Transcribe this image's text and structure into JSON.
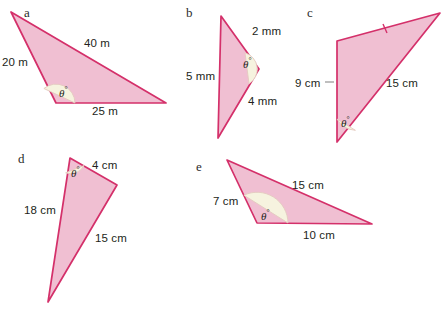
{
  "page": {
    "background_color": "#ffffff",
    "shape_fill": "#f0bfd2",
    "shape_stroke": "#d4306a",
    "arc_fill": "#f6f3df",
    "text_color": "#231f20",
    "width": 443,
    "height": 311
  },
  "figures": [
    {
      "key": "a",
      "letter": "a",
      "letter_pos": {
        "x": 24,
        "y": 6
      },
      "points": "11,12 56,103 166,103",
      "angle": {
        "label": "θ",
        "degree_symbol": "°",
        "pos": {
          "x": 59,
          "y": 86
        },
        "arc_path": "M 75,103 A 19,19 0 0 0 43.9,88.5 Z"
      },
      "side_labels": [
        {
          "name": "side-20m",
          "text": "20 m",
          "x": 2,
          "y": 57
        },
        {
          "name": "side-40m",
          "text": "40 m",
          "x": 84,
          "y": 38
        },
        {
          "name": "side-25m",
          "text": "25 m",
          "x": 92,
          "y": 106
        }
      ],
      "ticks": [],
      "leaders": []
    },
    {
      "key": "b",
      "letter": "b",
      "letter_pos": {
        "x": 186,
        "y": 6
      },
      "points": "221,16 259,69 218,138",
      "angle": {
        "label": "θ",
        "degree_symbol": "°",
        "pos": {
          "x": 243,
          "y": 57
        },
        "arc_path": "M 245,52.8 A 17,17 0 0 1 249,83.7 Z"
      },
      "side_labels": [
        {
          "name": "side-2mm",
          "text": "2 mm",
          "x": 252,
          "y": 26
        },
        {
          "name": "side-5mm",
          "text": "5 mm",
          "x": 186,
          "y": 71
        },
        {
          "name": "side-4mm",
          "text": "4 mm",
          "x": 248,
          "y": 96
        }
      ],
      "ticks": [],
      "leaders": []
    },
    {
      "key": "c",
      "letter": "c",
      "letter_pos": {
        "x": 307,
        "y": 6
      },
      "points": "337,41 440,13 337,142",
      "angle": {
        "label": "θ",
        "degree_symbol": "°",
        "pos": {
          "x": 341,
          "y": 116
        },
        "arc_path": "M 337,119 A 23,23 0 0 0 355.4,130.3 Z"
      },
      "side_labels": [
        {
          "name": "side-9cm",
          "text": "9 cm",
          "x": 295,
          "y": 78
        },
        {
          "name": "side-15cm",
          "text": "15 cm",
          "x": 386,
          "y": 78
        }
      ],
      "ticks": [
        {
          "name": "tick-top-edge",
          "x1": 383,
          "y1": 24,
          "x2": 387,
          "y2": 33
        }
      ],
      "leaders": [
        {
          "name": "leader-9cm",
          "x1": 325,
          "y1": 82,
          "x2": 334,
          "y2": 82
        }
      ]
    },
    {
      "key": "d",
      "letter": "d",
      "letter_pos": {
        "x": 18,
        "y": 152
      },
      "points": "70,158 117,185 48,302",
      "angle": {
        "label": "θ",
        "degree_symbol": "°",
        "pos": {
          "x": 71,
          "y": 166
        },
        "arc_path": "M 84.1,165.5 A 15,15 0 0 1 65.6,172.8 Z"
      },
      "side_labels": [
        {
          "name": "side-4cm",
          "text": "4 cm",
          "x": 92,
          "y": 160
        },
        {
          "name": "side-18cm",
          "text": "18 cm",
          "x": 24,
          "y": 205
        },
        {
          "name": "side-15cm",
          "text": "15 cm",
          "x": 95,
          "y": 233
        }
      ],
      "ticks": [],
      "leaders": []
    },
    {
      "key": "e",
      "letter": "e",
      "letter_pos": {
        "x": 196,
        "y": 160
      },
      "points": "227,160 372,224 257,223",
      "angle": {
        "label": "θ",
        "degree_symbol": "°",
        "pos": {
          "x": 261,
          "y": 209
        },
        "arc_path": "M 288,223 A 31,31 0 0 0 243.9,195.2 Z"
      },
      "side_labels": [
        {
          "name": "side-15cm",
          "text": "15 cm",
          "x": 292,
          "y": 180
        },
        {
          "name": "side-7cm",
          "text": "7 cm",
          "x": 213,
          "y": 196
        },
        {
          "name": "side-10cm",
          "text": "10 cm",
          "x": 303,
          "y": 230
        }
      ],
      "ticks": [],
      "leaders": []
    }
  ]
}
